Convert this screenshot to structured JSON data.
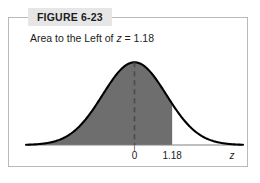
{
  "figure": {
    "label": "FIGURE 6-23",
    "caption_prefix": "Area to the Left of ",
    "caption_variable": "z",
    "caption_suffix": " = 1.18",
    "border_color": "#b9b9b9",
    "label_background": "#e6e6e6"
  },
  "chart_data": {
    "type": "area",
    "title": "Area to the Left of z = 1.18",
    "xlabel": "z",
    "ylabel": "",
    "distribution": "standard normal",
    "mean": 0,
    "standard_deviation": 1,
    "shaded_region": {
      "description": "area to the left of z = 1.18",
      "from": "-infinity",
      "to": 1.18,
      "fill_color": "#6e6e6e"
    },
    "mean_line": {
      "value": 0,
      "style": "dashed",
      "color": "#4a4a4a"
    },
    "curve_color": "#000000",
    "axis_color": "#808080",
    "grid": false,
    "legend": false,
    "xlim": [
      -3.4,
      3.4
    ],
    "ylim": [
      0,
      0.41
    ],
    "tick_labels": [
      {
        "value": 0,
        "text": "0"
      },
      {
        "value": 1.18,
        "text": "1.18"
      }
    ],
    "x": [
      -3.4,
      -3.2,
      -3.0,
      -2.8,
      -2.6,
      -2.4,
      -2.2,
      -2.0,
      -1.8,
      -1.6,
      -1.4,
      -1.2,
      -1.0,
      -0.8,
      -0.6,
      -0.4,
      -0.2,
      0.0,
      0.2,
      0.4,
      0.6,
      0.8,
      1.0,
      1.18,
      1.2,
      1.4,
      1.6,
      1.8,
      2.0,
      2.2,
      2.4,
      2.6,
      2.8,
      3.0,
      3.2,
      3.4
    ],
    "y": [
      0.0012,
      0.0024,
      0.0044,
      0.0079,
      0.0136,
      0.0224,
      0.0355,
      0.054,
      0.079,
      0.1109,
      0.1497,
      0.1942,
      0.242,
      0.2897,
      0.3332,
      0.3683,
      0.391,
      0.3989,
      0.391,
      0.3683,
      0.3332,
      0.2897,
      0.242,
      0.1989,
      0.1942,
      0.1497,
      0.1109,
      0.079,
      0.054,
      0.0355,
      0.0224,
      0.0136,
      0.0079,
      0.0044,
      0.0024,
      0.0012
    ]
  }
}
